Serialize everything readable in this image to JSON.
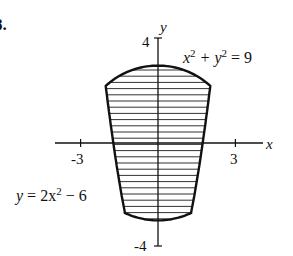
{
  "problem_number": "8.",
  "axes": {
    "x_label": "x",
    "y_label": "y",
    "x_ticks": [
      {
        "value": -3,
        "label": "-3"
      },
      {
        "value": 3,
        "label": "3"
      }
    ],
    "y_ticks": [
      {
        "value": 4,
        "label": "4"
      },
      {
        "value": -4,
        "label": "-4"
      }
    ]
  },
  "curves": {
    "circle": {
      "label_base": "x",
      "label_mid": " + y",
      "label_end": " = 9",
      "sup": "2",
      "equation": "x^2 + y^2 = 9"
    },
    "parabola": {
      "label_a": "y",
      "label_b": " = 2x",
      "label_c": " − 6",
      "sup": "2",
      "equation": "y = 2x^2 - 6"
    }
  },
  "region": {
    "fill": "horizontal-hatching",
    "bounded_by": [
      "x^2 + y^2 = 9",
      "y = 2x^2 - 6"
    ]
  },
  "colors": {
    "stroke": "#111111",
    "hatch": "#333333",
    "background": "#ffffff"
  }
}
